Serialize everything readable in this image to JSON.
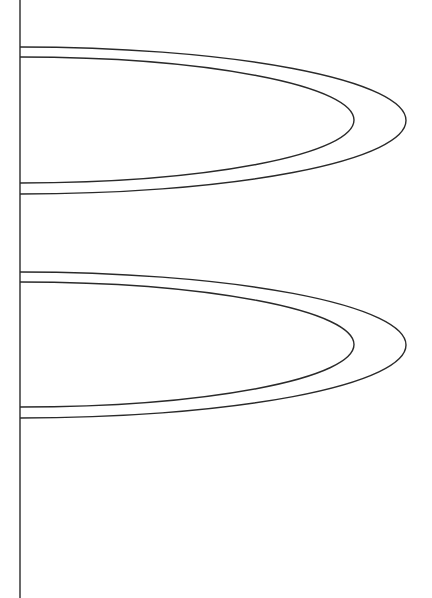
{
  "canvas": {
    "width": 432,
    "height": 598,
    "background": "#ffffff"
  },
  "stroke": {
    "color": "#2a2a2a",
    "width": 1.4
  },
  "spine": {
    "x": 20,
    "y1": 0,
    "y2": 598
  },
  "loops": [
    {
      "name": "upper-loop",
      "center_y": 120,
      "outer": {
        "top": 47,
        "bottom": 194,
        "right": 406
      },
      "inner": {
        "top": 57,
        "bottom": 183,
        "right": 354
      }
    },
    {
      "name": "lower-loop",
      "center_y": 345,
      "outer": {
        "top": 272,
        "bottom": 418,
        "right": 406
      },
      "inner": {
        "top": 282,
        "bottom": 407,
        "right": 354
      }
    }
  ]
}
